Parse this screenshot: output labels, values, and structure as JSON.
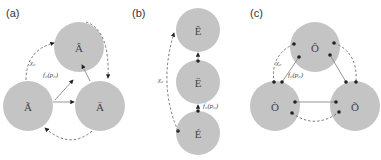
{
  "panels": [
    {
      "label": "(a)",
      "nodes": [
        {
          "id": "top",
          "text": "Â"
        },
        {
          "id": "bottom-left",
          "text": "Ã"
        },
        {
          "id": "bottom-right",
          "text": "Ä"
        }
      ],
      "annotations": {
        "chi": "χ₀",
        "f": "f₀(p₀)"
      }
    },
    {
      "label": "(b)",
      "nodes": [
        {
          "id": "top",
          "text": "Ê"
        },
        {
          "id": "middle",
          "text": "Ë"
        },
        {
          "id": "bottom",
          "text": "É"
        }
      ],
      "annotations": {
        "chi": "χ₀",
        "f": "f₀(p₀)"
      }
    },
    {
      "label": "(c)",
      "nodes": [
        {
          "id": "top",
          "text": "Ô"
        },
        {
          "id": "bottom-left",
          "text": "Ò"
        },
        {
          "id": "bottom-right",
          "text": "Õ"
        }
      ],
      "annotations": {
        "chi": "χ₀",
        "f": "f₀(p₀)"
      }
    }
  ],
  "colors": {
    "node_fill": "#c4c4c4",
    "edge": "#6a6a6a",
    "dot": "#222222"
  }
}
